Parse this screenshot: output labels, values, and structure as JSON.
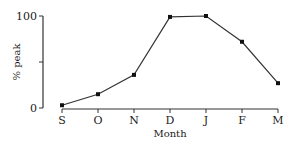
{
  "chart_data": {
    "type": "line",
    "title": "",
    "xlabel": "Month",
    "ylabel": "% peak",
    "categories": [
      "S",
      "O",
      "N",
      "D",
      "J",
      "F",
      "M"
    ],
    "values": [
      3,
      15,
      36,
      99,
      100,
      72,
      27
    ],
    "ylim": [
      0,
      100
    ],
    "y_ticks": [
      0,
      50,
      100
    ],
    "y_tick_labels": [
      "0",
      "",
      "100"
    ],
    "grid": false,
    "legend": null,
    "markers": true
  }
}
